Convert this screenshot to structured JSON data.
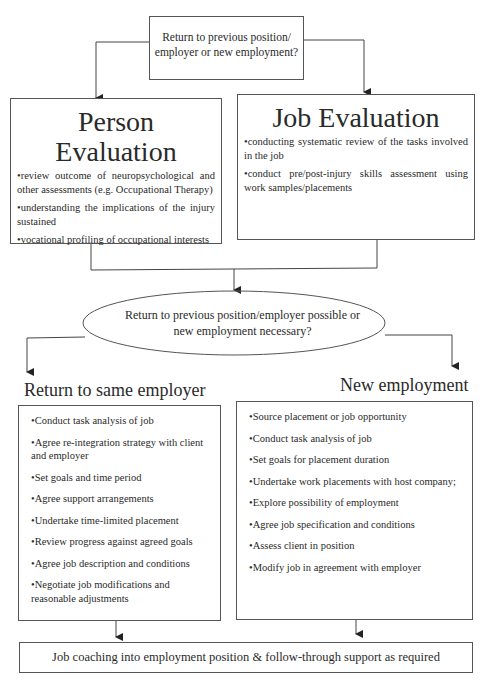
{
  "top_question": {
    "line1": "Return to previous position/",
    "line2": "employer or new employment?"
  },
  "person_evaluation": {
    "title": "Person Evaluation",
    "items": [
      "•review outcome of neuropsychological and other assessments (e.g. Occupational Therapy)",
      "•understanding the implications of the injury sustained",
      "•vocational profiling of occupational interests"
    ]
  },
  "job_evaluation": {
    "title": "Job Evaluation",
    "items": [
      "•conducting systematic review of the tasks involved in the job",
      "•conduct pre/post-injury skills assessment using work samples/placements"
    ]
  },
  "decision": {
    "line1": "Return to previous position/employer possible or",
    "line2": "new employment necessary?"
  },
  "same_employer": {
    "title": "Return to same employer",
    "items": [
      "•Conduct task analysis of job",
      "•Agree re-integration strategy with client and employer",
      "•Set goals and time period",
      "•Agree support arrangements",
      "•Undertake time-limited placement",
      "•Review progress against agreed goals",
      "•Agree job description and conditions",
      "•Negotiate job modifications and reasonable adjustments"
    ]
  },
  "new_employment": {
    "title": "New employment",
    "items": [
      "•Source placement or job opportunity",
      "•Conduct task analysis of job",
      "•Set goals for placement duration",
      "•Undertake work placements with host company;",
      "•Explore possibility of employment",
      "•Agree job specification and conditions",
      "•Assess client in position",
      "•Modify job in agreement with employer"
    ]
  },
  "footer": {
    "text": "Job coaching into employment position & follow-through support as required"
  }
}
